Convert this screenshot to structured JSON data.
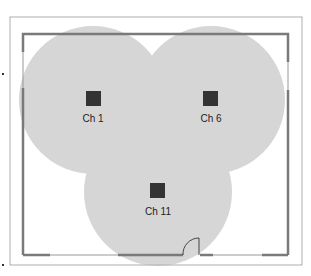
{
  "diagram": {
    "title": "",
    "access_points": [
      {
        "label": "Ch 1",
        "cx": 93,
        "cy": 100
      },
      {
        "label": "Ch 6",
        "cx": 211,
        "cy": 100
      },
      {
        "label": "Ch 11",
        "cx": 158,
        "cy": 192
      }
    ],
    "coverage_radius": 74,
    "colors": {
      "coverage": "#c8c8c8",
      "wall": "#7a7a7a",
      "ap": "#333333",
      "frame": "#888888"
    }
  }
}
